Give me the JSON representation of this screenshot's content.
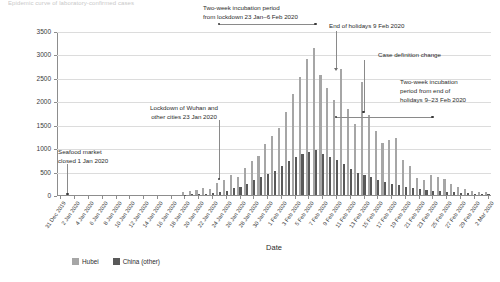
{
  "figure": {
    "cut_title": "Epidemic curve of laboratory-confirmed cases"
  },
  "legend": {
    "items": [
      {
        "label": "Hubei",
        "color": "#a6a6a6"
      },
      {
        "label": "China (other)",
        "color": "#595959"
      }
    ]
  },
  "annotations": [
    {
      "id": "seafood",
      "text": "Seafood market\nclosed 1 Jan 2020"
    },
    {
      "id": "lockdown",
      "text": "Lockdown of Wuhan and\nother cities 23 Jan 2020"
    },
    {
      "id": "incubation1",
      "text": "Two-week incubation period\nfrom lockdown 23 Jan–6 Feb 2020"
    },
    {
      "id": "holidays",
      "text": "End of holidays 9 Feb 2020"
    },
    {
      "id": "casedef",
      "text": "Case definition change"
    },
    {
      "id": "incubation2",
      "text": "Two-week incubation\nperiod from end of\nholidays 9–23 Feb 2020"
    }
  ],
  "chart_data": {
    "type": "bar",
    "title": "",
    "xlabel": "Date",
    "ylabel": "Laboratory-confirmed new cases (n)",
    "ylim": [
      0,
      3500
    ],
    "yticks": [
      0,
      500,
      1000,
      1500,
      2000,
      2500,
      3000,
      3500
    ],
    "grid": true,
    "legend_position": "bottom-left",
    "x": [
      "31 Dec 2019",
      "1 Jan 2020",
      "2 Jan 2020",
      "3 Jan 2020",
      "4 Jan 2020",
      "5 Jan 2020",
      "6 Jan 2020",
      "7 Jan 2020",
      "8 Jan 2020",
      "9 Jan 2020",
      "10 Jan 2020",
      "11 Jan 2020",
      "12 Jan 2020",
      "13 Jan 2020",
      "14 Jan 2020",
      "15 Jan 2020",
      "16 Jan 2020",
      "17 Jan 2020",
      "18 Jan 2020",
      "19 Jan 2020",
      "20 Jan 2020",
      "21 Jan 2020",
      "22 Jan 2020",
      "23 Jan 2020",
      "24 Jan 2020",
      "25 Jan 2020",
      "26 Jan 2020",
      "27 Jan 2020",
      "28 Jan 2020",
      "29 Jan 2020",
      "30 Jan 2020",
      "31 Jan 2020",
      "1 Feb 2020",
      "2 Feb 2020",
      "3 Feb 2020",
      "4 Feb 2020",
      "5 Feb 2020",
      "6 Feb 2020",
      "7 Feb 2020",
      "8 Feb 2020",
      "9 Feb 2020",
      "10 Feb 2020",
      "11 Feb 2020",
      "12 Feb 2020",
      "13 Feb 2020",
      "14 Feb 2020",
      "15 Feb 2020",
      "16 Feb 2020",
      "17 Feb 2020",
      "18 Feb 2020",
      "19 Feb 2020",
      "20 Feb 2020",
      "21 Feb 2020",
      "22 Feb 2020",
      "23 Feb 2020",
      "24 Feb 2020",
      "25 Feb 2020",
      "26 Feb 2020",
      "27 Feb 2020",
      "28 Feb 2020",
      "29 Feb 2020",
      "1 Mar 2020",
      "2 Mar 2020"
    ],
    "xtick_labels": [
      "31 Dec 2019",
      "2 Jan 2020",
      "4 Jan 2020",
      "6 Jan 2020",
      "8 Jan 2020",
      "10 Jan 2020",
      "12 Jan 2020",
      "14 Jan 2020",
      "16 Jan 2020",
      "18 Jan 2020",
      "20 Jan 2020",
      "22 Jan 2020",
      "24 Jan 2020",
      "26 Jan 2020",
      "28 Jan 2020",
      "30 Jan 2020",
      "1 Feb 2020",
      "3 Feb 2020",
      "5 Feb 2020",
      "7 Feb 2020",
      "9 Feb 2020",
      "11 Feb 2020",
      "13 Feb 2020",
      "15 Feb 2020",
      "17 Feb 2020",
      "19 Feb 2020",
      "21 Feb 2020",
      "23 Feb 2020",
      "25 Feb 2020",
      "27 Feb 2020",
      "29 Feb 2020",
      "2 Mar 2020"
    ],
    "series": [
      {
        "name": "Hubei",
        "color": "#a6a6a6",
        "values": [
          0,
          0,
          0,
          0,
          0,
          0,
          0,
          0,
          0,
          0,
          0,
          0,
          0,
          0,
          0,
          0,
          0,
          0,
          60,
          80,
          100,
          150,
          130,
          260,
          320,
          420,
          380,
          580,
          730,
          840,
          1080,
          1250,
          1420,
          1780,
          2160,
          2520,
          2900,
          3140,
          2560,
          2280,
          2020,
          2680,
          1840,
          1520,
          2410,
          1700,
          1360,
          1100,
          1180,
          1220,
          740,
          620,
          360,
          320,
          420,
          380,
          340,
          240,
          170,
          120,
          90,
          70,
          60
        ]
      },
      {
        "name": "China (other)",
        "color": "#595959",
        "values": [
          0,
          0,
          0,
          0,
          0,
          0,
          0,
          0,
          0,
          0,
          0,
          0,
          0,
          0,
          0,
          0,
          0,
          0,
          10,
          15,
          20,
          30,
          40,
          60,
          90,
          140,
          180,
          240,
          320,
          380,
          440,
          520,
          620,
          730,
          810,
          880,
          920,
          960,
          880,
          820,
          740,
          660,
          560,
          480,
          420,
          380,
          320,
          280,
          240,
          210,
          180,
          150,
          130,
          110,
          90,
          80,
          70,
          60,
          50,
          40,
          30,
          25,
          20
        ]
      }
    ]
  }
}
